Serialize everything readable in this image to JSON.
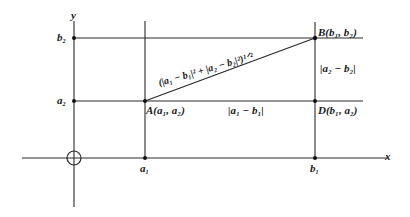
{
  "diagram": {
    "type": "coordinate-geometry-distance",
    "colors": {
      "line": "#2a2a2a",
      "point": "#111111",
      "background": "#ffffff"
    },
    "axes": {
      "x_label": "x",
      "y_label": "y",
      "origin_marker": "circle"
    },
    "tick_labels": {
      "a1": "a",
      "a1_sub": "1",
      "b1": "b",
      "b1_sub": "1",
      "a2": "a",
      "a2_sub": "2",
      "b2": "b",
      "b2_sub": "2"
    },
    "points": {
      "A": {
        "name": "A",
        "coords": "(a₁, a₂)"
      },
      "B": {
        "name": "B",
        "coords": "(b₁, b₂)"
      },
      "D": {
        "name": "D",
        "coords": "(b₁, a₂)"
      }
    },
    "segment_labels": {
      "horizontal": "|a₁ − b₁|",
      "vertical": "|a₂ − b₂|",
      "hypotenuse": "(|a₁ − b₁|² + |a₂ − b₂|²)¹ᐟ²"
    }
  }
}
